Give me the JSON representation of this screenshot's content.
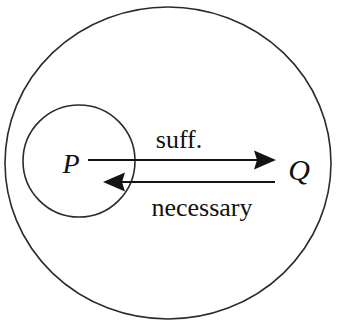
{
  "diagram": {
    "type": "euler-diagram-with-implication-arrows",
    "background_color": "#ffffff",
    "stroke_color": "#2b2b2b",
    "arrow_color": "#141414",
    "text_color": "#111111",
    "sets": [
      {
        "id": "outer",
        "label": "Q",
        "label_text": "Q",
        "shape": "ellipse",
        "center_x": 168,
        "center_y": 163,
        "radius_x": 163,
        "radius_y": 156,
        "label_x": 299,
        "label_y": 180,
        "label_font_size": 30
      },
      {
        "id": "inner",
        "label": "P",
        "label_text": "P",
        "shape": "circle",
        "center_x": 79,
        "center_y": 161,
        "radius_x": 56,
        "radius_y": 56,
        "label_x": 71,
        "label_y": 173,
        "label_font_size": 28
      }
    ],
    "arrows": [
      {
        "id": "suff",
        "label": "suff.",
        "direction": "P-to-Q",
        "points_right": true,
        "line_y": 160,
        "line_x1": 88,
        "line_x2": 266,
        "tip_x": 276,
        "label_x": 179,
        "label_y": 148,
        "label_font_size": 26
      },
      {
        "id": "necessary",
        "label": "necessary",
        "direction": "Q-to-P",
        "points_right": false,
        "line_y": 182,
        "line_x1": 113,
        "line_x2": 275,
        "tip_x": 103,
        "label_x": 202,
        "label_y": 216,
        "label_font_size": 26
      }
    ]
  }
}
